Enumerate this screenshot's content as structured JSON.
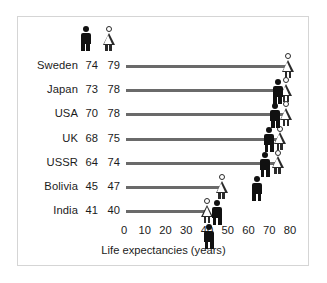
{
  "chart_data": {
    "type": "bar",
    "title": "",
    "xlabel": "Life expectancies (years)",
    "ylabel": "",
    "xlim": [
      0,
      80
    ],
    "xticks": [
      0,
      10,
      20,
      30,
      40,
      50,
      60,
      70,
      80
    ],
    "grid": false,
    "legend_position": "top",
    "categories": [
      "Sweden",
      "Japan",
      "USA",
      "UK",
      "USSR",
      "Bolivia",
      "India"
    ],
    "series": [
      {
        "name": "male",
        "icon": "male-figure-icon",
        "color": "#111111",
        "values": [
          74,
          73,
          70,
          68,
          64,
          45,
          41
        ]
      },
      {
        "name": "female",
        "icon": "female-figure-icon",
        "color": "#ffffff",
        "values": [
          79,
          78,
          78,
          75,
          74,
          47,
          40
        ]
      }
    ],
    "rows": [
      {
        "country": "Sweden",
        "male": "74",
        "female": "79"
      },
      {
        "country": "Japan",
        "male": "73",
        "female": "78"
      },
      {
        "country": "USA",
        "male": "70",
        "female": "78"
      },
      {
        "country": "UK",
        "male": "68",
        "female": "75"
      },
      {
        "country": "USSR",
        "male": "64",
        "female": "74"
      },
      {
        "country": "Bolivia",
        "male": "45",
        "female": "47"
      },
      {
        "country": "India",
        "male": "41",
        "female": "40"
      }
    ],
    "tick_labels": [
      "0",
      "10",
      "20",
      "30",
      "40",
      "50",
      "60",
      "70",
      "80"
    ],
    "colors": {
      "line": "#6a6a6a",
      "male_fill": "#111111",
      "female_fill": "#ffffff",
      "female_stroke": "#2a2a2a",
      "text": "#1b1b1b",
      "border": "#d5d5d5",
      "background": "#ffffff"
    }
  }
}
